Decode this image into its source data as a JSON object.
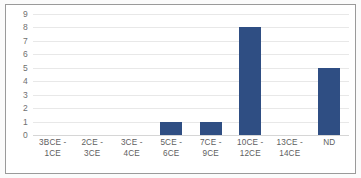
{
  "chart_data": {
    "type": "bar",
    "title": "",
    "subtitle": "",
    "xlabel": "",
    "ylabel": "",
    "categories": [
      "3BCE - 1CE",
      "2CE - 3CE",
      "3CE - 4CE",
      "5CE - 6CE",
      "7CE - 9CE",
      "10CE -\n12CE",
      "13CE -\n14CE",
      "ND"
    ],
    "values": [
      0,
      0,
      0,
      1,
      1,
      8,
      0,
      5
    ],
    "ylim": [
      0,
      9
    ],
    "ytick_labels": [
      "9",
      "8",
      "7",
      "6",
      "5",
      "4",
      "3",
      "2",
      "1",
      "0"
    ],
    "ytick_values": [
      9,
      8,
      7,
      6,
      5,
      4,
      3,
      2,
      1,
      0
    ],
    "grid": true,
    "legend": false,
    "legend_position": "none",
    "bar_color": "#2f4e83",
    "gridline_color": "#e8e8e8",
    "axis_label_color": "#5e5e5e",
    "frame_border_color": "#9a9a9a",
    "plot_background": "#ffffff",
    "annotations": []
  }
}
